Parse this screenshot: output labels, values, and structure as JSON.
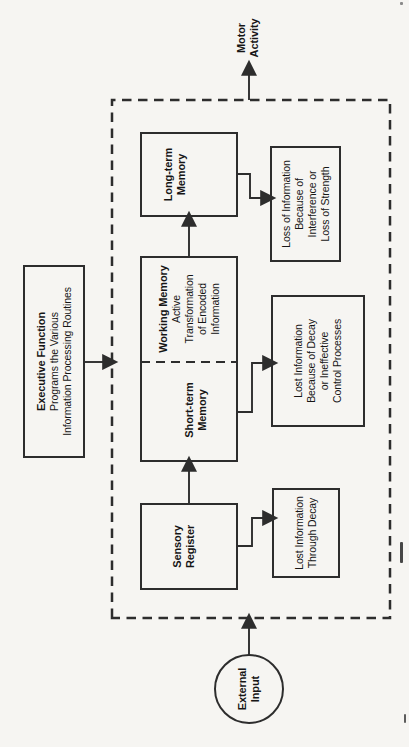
{
  "figure": {
    "type": "flow-diagram",
    "orientation": "rotated-90-ccw",
    "colors": {
      "paper": "#f6f5f2",
      "ink": "#2d2d2d",
      "text": "#161616"
    }
  },
  "nodes": {
    "external_input": {
      "line1": "External",
      "line2": "Input"
    },
    "motor_activity": {
      "line1": "Motor",
      "line2": "Activity"
    },
    "executive_function": {
      "title": "Executive Function",
      "line1": "Programs the Various",
      "line2": "Information Processing Routines"
    },
    "sensory_register": {
      "line1": "Sensory",
      "line2": "Register"
    },
    "short_term_memory": {
      "line1": "Short-term",
      "line2": "Memory"
    },
    "working_memory": {
      "title": "Working Memory",
      "line1": "Active",
      "line2": "Transformation",
      "line3": "of Encoded",
      "line4": "Information"
    },
    "long_term_memory": {
      "line1": "Long-term",
      "line2": "Memory"
    },
    "loss_sensory": {
      "line1": "Lost Information",
      "line2": "Through Decay"
    },
    "loss_short_term": {
      "line1": "Lost Information",
      "line2": "Because of Decay",
      "line3": "or Ineffective",
      "line4": "Control Processes"
    },
    "loss_long_term": {
      "line1": "Loss of Information",
      "line2": "Because of",
      "line3": "Interference or",
      "line4": "Loss of Strength"
    }
  }
}
